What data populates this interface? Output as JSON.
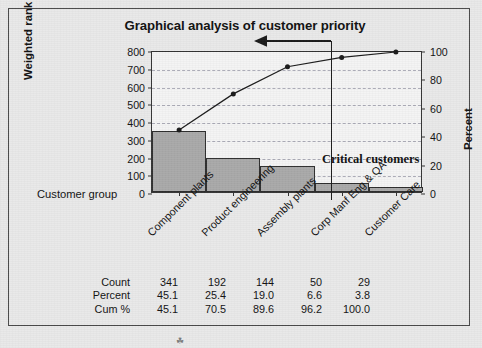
{
  "figure": {
    "background_color": "#e9e9e9",
    "frame_color": "#4a4a4a",
    "title": "Graphical analysis of customer priority",
    "artifact_mark": "☘"
  },
  "annotation": {
    "critical_label": "Critical customers",
    "arrow_name": "leftward-arrow",
    "divider_name": "critical-cutoff-line"
  },
  "chart_data": {
    "type": "bar",
    "chart_subtype": "pareto",
    "title": "Graphical analysis of customer priority",
    "xlabel": "Customer group",
    "ylabel": "Weighted rank",
    "y2label": "Percent",
    "categories": [
      "Component plants",
      "Product engineering",
      "Assembly plants",
      "Corp Manf Eng & QA",
      "Customer Care"
    ],
    "series": [
      {
        "name": "Count",
        "type": "bar",
        "values": [
          341,
          192,
          144,
          50,
          29
        ],
        "color": "#a9a9a9",
        "edge_color": "#2e2e2e"
      },
      {
        "name": "Cum %",
        "type": "line",
        "axis": "y2",
        "values": [
          45.1,
          70.5,
          89.6,
          96.2,
          100.0
        ],
        "color": "#1a1a1a",
        "marker": "circle"
      }
    ],
    "ylim": [
      0,
      800
    ],
    "yticks": [
      0,
      100,
      200,
      300,
      400,
      500,
      600,
      700,
      800
    ],
    "y2lim": [
      0,
      100
    ],
    "y2ticks": [
      0,
      20,
      40,
      60,
      80,
      100
    ],
    "grid": true,
    "grid_style": "dashed",
    "legend": "none",
    "annotations": [
      "Critical customers"
    ]
  },
  "table": {
    "rows": [
      {
        "label": "Count",
        "values": [
          "341",
          "192",
          "144",
          "50",
          "29"
        ]
      },
      {
        "label": "Percent",
        "values": [
          "45.1",
          "25.4",
          "19.0",
          "6.6",
          "3.8"
        ]
      },
      {
        "label": "Cum %",
        "values": [
          "45.1",
          "70.5",
          "89.6",
          "96.2",
          "100.0"
        ]
      }
    ]
  }
}
